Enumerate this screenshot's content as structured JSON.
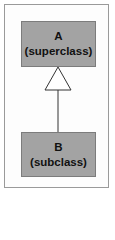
{
  "diagram": {
    "type": "uml-inheritance",
    "superclass": {
      "name": "A",
      "role": "(superclass)"
    },
    "subclass": {
      "name": "B",
      "role": "(subclass)"
    },
    "relation": "generalization",
    "arrow_icon": "hollow-triangle"
  },
  "colors": {
    "box_fill": "#a3a3a3",
    "box_border": "#7c7c7c",
    "frame_border": "#9a9a9a",
    "line": "#333333"
  }
}
